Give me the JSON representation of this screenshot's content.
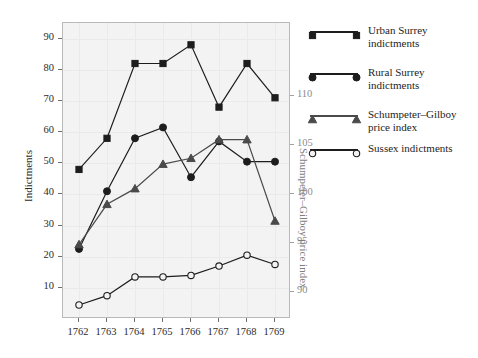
{
  "chart_data": {
    "type": "line",
    "title": "",
    "xlabel": "",
    "ylabel": "Indictments",
    "y2label": "Schumpeter–Gilboy price index",
    "x": [
      1762,
      1763,
      1764,
      1765,
      1766,
      1767,
      1768,
      1769
    ],
    "categories": [
      "1762",
      "1763",
      "1764",
      "1765",
      "1766",
      "1767",
      "1768",
      "1769"
    ],
    "ylim": [
      0,
      95
    ],
    "yticks": [
      10,
      20,
      30,
      40,
      50,
      60,
      70,
      80,
      90
    ],
    "ytick_labels": [
      "10",
      "20",
      "30",
      "40",
      "50",
      "60",
      "70",
      "80",
      "90"
    ],
    "y2lim": [
      87.2,
      117.4
    ],
    "y2ticks": [
      90,
      95,
      100,
      105,
      110
    ],
    "y2tick_labels": [
      "90",
      "95",
      "100",
      "105",
      "110"
    ],
    "grid": true,
    "legend_position": "right",
    "series": [
      {
        "name": "Urban Surrey indictments",
        "legend_label_lines": [
          "Urban Surrey",
          "indictments"
        ],
        "marker": "filled-square",
        "axis": "left",
        "color": "#1d1d1d",
        "values": [
          48,
          58,
          82,
          82,
          88,
          68,
          82,
          71
        ]
      },
      {
        "name": "Rural Surrey indictments",
        "legend_label_lines": [
          "Rural Surrey",
          "indictments"
        ],
        "marker": "filled-circle",
        "axis": "left",
        "color": "#1d1d1d",
        "values": [
          22.5,
          41,
          58,
          61.5,
          45.5,
          57,
          50.5,
          50.5
        ]
      },
      {
        "name": "Schumpeter–Gilboy price index",
        "legend_label_lines": [
          "Schumpeter–Gilboy",
          "price index"
        ],
        "marker": "filled-triangle",
        "axis": "right",
        "color": "#4a4a4a",
        "values": [
          94.8,
          98.9,
          100.5,
          103.0,
          103.6,
          105.5,
          105.5,
          97.2
        ]
      },
      {
        "name": "Sussex indictments",
        "legend_label_lines": [
          "Sussex indictments"
        ],
        "marker": "open-circle",
        "axis": "left",
        "color": "#1d1d1d",
        "values": [
          4.5,
          7.5,
          13.5,
          13.5,
          14,
          17,
          20.5,
          17.5
        ]
      }
    ]
  },
  "axes": {
    "left_title": "Indictments",
    "right_title": "Schumpeter–Gilboy price index"
  }
}
